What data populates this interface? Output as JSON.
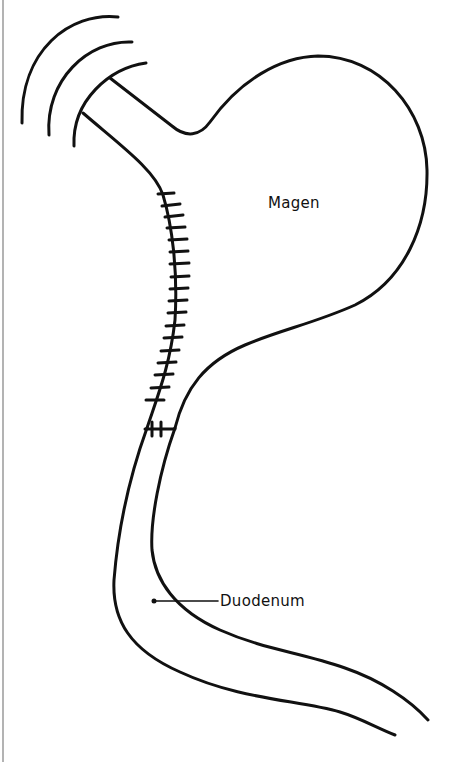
{
  "diagram": {
    "type": "anatomical-sketch",
    "labels": {
      "stomach": "Magen",
      "duodenum": "Duodenum"
    },
    "colors": {
      "line": "#111111",
      "background": "#ffffff",
      "border": "#9a9a9a"
    },
    "annotations": [
      {
        "id": "stomach-label",
        "text": "Magen",
        "position": [
          268,
          206
        ]
      },
      {
        "id": "duodenum-label",
        "text": "Duodenum",
        "position": [
          194,
          603
        ],
        "leader_to": [
          154,
          600
        ]
      }
    ],
    "staple_line": {
      "tick_count": 18,
      "cross_staples": 2
    },
    "esophagus_cut_arcs": 3
  }
}
